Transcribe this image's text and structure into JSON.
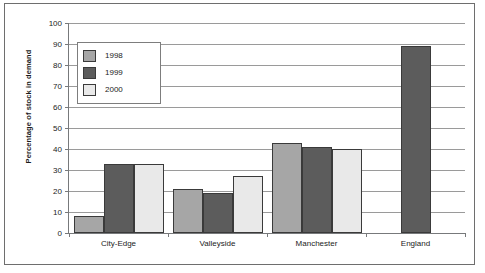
{
  "chart_data": {
    "type": "bar",
    "title": "",
    "xlabel": "",
    "ylabel": "Percentage of stock in demand",
    "categories": [
      "City-Edge",
      "Valleyside",
      "Manchester",
      "England"
    ],
    "series": [
      {
        "name": "1998",
        "color": "#a6a6a6",
        "values": [
          8,
          21,
          43,
          null
        ]
      },
      {
        "name": "1999",
        "color": "#5c5c5c",
        "values": [
          33,
          19,
          41,
          89
        ]
      },
      {
        "name": "2000",
        "color": "#e9e9e9",
        "values": [
          33,
          27,
          40,
          null
        ]
      }
    ],
    "ylim": [
      0,
      100
    ],
    "yticks": [
      0,
      10,
      20,
      30,
      40,
      50,
      60,
      70,
      80,
      90,
      100
    ],
    "ytick_labels": [
      "0",
      "10",
      "20",
      "30",
      "40",
      "50",
      "60",
      "70",
      "80",
      "90",
      "100"
    ],
    "grid": true,
    "legend_position": "upper-left-inside"
  },
  "legend": {
    "entries": [
      {
        "label": "1998"
      },
      {
        "label": "1999"
      },
      {
        "label": "2000"
      }
    ]
  },
  "axis": {
    "y_title": "Percentage of stock in demand"
  }
}
